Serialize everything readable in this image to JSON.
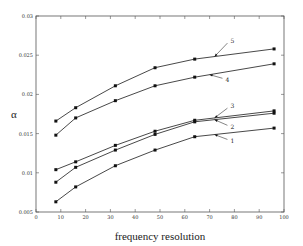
{
  "chart_data": {
    "type": "line",
    "title": "",
    "xlabel": "frequency resolution",
    "ylabel": "α",
    "xlim": [
      0,
      100
    ],
    "ylim": [
      0.005,
      0.03
    ],
    "x_ticks": [
      "0",
      "10",
      "20",
      "30",
      "40",
      "50",
      "60",
      "70",
      "80",
      "90",
      "100"
    ],
    "y_ticks": [
      "0.005",
      "0.01",
      "0.015",
      "0.02",
      "0.025",
      "0.03"
    ],
    "grid": false,
    "legend": "inline numeric annotations with arrows",
    "x": [
      8,
      16,
      32,
      48,
      64,
      96
    ],
    "series": [
      {
        "name": "1",
        "values": [
          0.0063,
          0.0082,
          0.0109,
          0.0129,
          0.0146,
          0.0157
        ]
      },
      {
        "name": "2",
        "values": [
          0.0088,
          0.0107,
          0.0129,
          0.0149,
          0.0165,
          0.0176
        ]
      },
      {
        "name": "3",
        "values": [
          0.0104,
          0.0114,
          0.0135,
          0.0153,
          0.0167,
          0.0179
        ]
      },
      {
        "name": "4",
        "values": [
          0.0148,
          0.017,
          0.0192,
          0.0211,
          0.0222,
          0.0239
        ]
      },
      {
        "name": "5",
        "values": [
          0.0166,
          0.0183,
          0.0211,
          0.0234,
          0.0245,
          0.0258
        ]
      }
    ],
    "annotations": [
      {
        "label": "1",
        "arrow_to_x": 72,
        "text_x": 78,
        "text_y": 0.014
      },
      {
        "label": "2",
        "arrow_to_x": 72,
        "text_x": 78,
        "text_y": 0.0158
      },
      {
        "label": "3",
        "arrow_to_x": 72,
        "text_x": 78,
        "text_y": 0.0185
      },
      {
        "label": "4",
        "arrow_to_x": 70,
        "text_x": 76,
        "text_y": 0.0218
      },
      {
        "label": "5",
        "arrow_to_x": 72,
        "text_x": 78,
        "text_y": 0.0268
      }
    ]
  }
}
